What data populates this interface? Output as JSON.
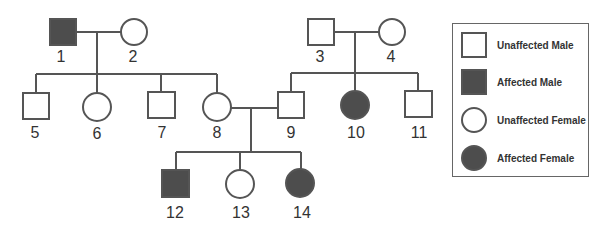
{
  "diagram": {
    "type": "pedigree",
    "colors": {
      "affected": "#4d4d4d",
      "unaffected": "#ffffff",
      "line": "#555555"
    },
    "individuals": [
      {
        "id": "1",
        "sex": "male",
        "affected": true,
        "generation": 1
      },
      {
        "id": "2",
        "sex": "female",
        "affected": false,
        "generation": 1
      },
      {
        "id": "3",
        "sex": "male",
        "affected": false,
        "generation": 1
      },
      {
        "id": "4",
        "sex": "female",
        "affected": false,
        "generation": 1
      },
      {
        "id": "5",
        "sex": "male",
        "affected": false,
        "generation": 2
      },
      {
        "id": "6",
        "sex": "female",
        "affected": false,
        "generation": 2
      },
      {
        "id": "7",
        "sex": "male",
        "affected": false,
        "generation": 2
      },
      {
        "id": "8",
        "sex": "female",
        "affected": false,
        "generation": 2
      },
      {
        "id": "9",
        "sex": "male",
        "affected": false,
        "generation": 2
      },
      {
        "id": "10",
        "sex": "female",
        "affected": true,
        "generation": 2
      },
      {
        "id": "11",
        "sex": "male",
        "affected": false,
        "generation": 2
      },
      {
        "id": "12",
        "sex": "male",
        "affected": true,
        "generation": 3
      },
      {
        "id": "13",
        "sex": "female",
        "affected": false,
        "generation": 3
      },
      {
        "id": "14",
        "sex": "female",
        "affected": true,
        "generation": 3
      }
    ],
    "matings": [
      {
        "partners": [
          "1",
          "2"
        ],
        "children": [
          "5",
          "6",
          "7",
          "8"
        ]
      },
      {
        "partners": [
          "3",
          "4"
        ],
        "children": [
          "9",
          "10",
          "11"
        ]
      },
      {
        "partners": [
          "8",
          "9"
        ],
        "children": [
          "12",
          "13",
          "14"
        ]
      }
    ],
    "labels": [
      "1",
      "2",
      "3",
      "4",
      "5",
      "6",
      "7",
      "8",
      "9",
      "10",
      "11",
      "12",
      "13",
      "14"
    ]
  },
  "legend": {
    "items": [
      {
        "label": "Unaffected Male",
        "shape": "square",
        "filled": false
      },
      {
        "label": "Affected Male",
        "shape": "square",
        "filled": true
      },
      {
        "label": "Unaffected Female",
        "shape": "circle",
        "filled": false
      },
      {
        "label": "Affected Female",
        "shape": "circle",
        "filled": true
      }
    ]
  }
}
